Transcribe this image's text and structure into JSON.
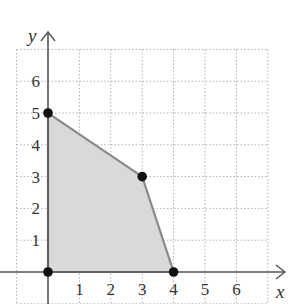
{
  "chart_data": {
    "type": "area",
    "title": "",
    "xlabel": "x",
    "ylabel": "y",
    "xlim": [
      -1,
      7
    ],
    "ylim": [
      -1,
      7
    ],
    "grid": true,
    "grid_style": "dotted",
    "x_ticks": [
      "1",
      "2",
      "3",
      "4",
      "5",
      "6"
    ],
    "y_ticks": [
      "1",
      "2",
      "3",
      "4",
      "5",
      "6"
    ],
    "feasible_region": {
      "vertices": [
        [
          0,
          0
        ],
        [
          0,
          5
        ],
        [
          3,
          3
        ],
        [
          4,
          0
        ]
      ],
      "fill": "#d9d9d9",
      "edge": "#8a8a8a"
    },
    "points": [
      {
        "x": 0,
        "y": 0
      },
      {
        "x": 0,
        "y": 5
      },
      {
        "x": 3,
        "y": 3
      },
      {
        "x": 4,
        "y": 0
      }
    ],
    "legend": null
  },
  "colors": {
    "axis": "#555555",
    "grid": "#b0b0b0",
    "point": "#111111",
    "fill": "#d9d9d9",
    "edge": "#8a8a8a"
  }
}
